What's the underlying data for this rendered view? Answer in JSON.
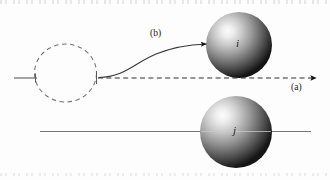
{
  "figure": {
    "type": "diagram",
    "background_color": "#fdfdfd",
    "width": 330,
    "height": 180
  },
  "labels": {
    "path_a": "(a)",
    "path_b": "(b)",
    "sphere_i": "i",
    "sphere_j": "j"
  },
  "colors": {
    "line": "#5a5a5a",
    "dashed_circle": "#6b6b7a",
    "trajectory": "#3a3a3a",
    "arrow": "#111111",
    "sphere_dark": "#171717",
    "sphere_light": "#f2f2f2",
    "text": "#1a1a1a"
  },
  "elements": {
    "dashed_circle": {
      "name": "incoming-particle-outline",
      "cx": 65.5,
      "cy": 73,
      "rx": 31,
      "ry": 29,
      "style": "dashed"
    },
    "sphere_i": {
      "name": "target-sphere-i",
      "cx": 239,
      "cy": 45,
      "r": 33,
      "highlight_x": 228,
      "highlight_y": 36
    },
    "sphere_j": {
      "name": "target-sphere-j",
      "cx": 236,
      "cy": 132,
      "r": 36,
      "highlight_x": 222,
      "highlight_y": 122
    },
    "incoming_line": {
      "name": "incoming-axis-line",
      "x1": 14,
      "y1": 78,
      "x2": 36,
      "y2": 78
    },
    "path_a_dashed_arrow": {
      "name": "trajectory-a-dashed-arrow",
      "x1": 97,
      "y1": 78,
      "x2": 318,
      "y2": 78,
      "style": "dashed",
      "arrowhead": "end"
    },
    "path_b_curve_arrow": {
      "name": "trajectory-b-curved-arrow",
      "start_x": 99,
      "start_y": 77,
      "end_x": 210,
      "end_y": 44,
      "style": "solid",
      "arrowhead": "end"
    },
    "baseline": {
      "name": "lower-axis-line",
      "x1": 40,
      "y1": 131,
      "x2": 311,
      "y2": 131
    }
  }
}
